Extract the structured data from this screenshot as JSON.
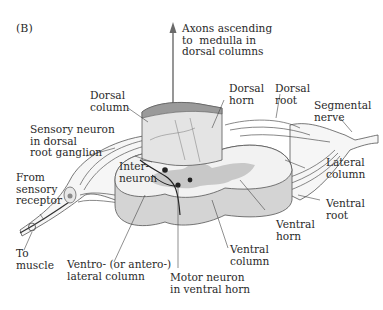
{
  "figure": {
    "panel_label": "(B)",
    "colors": {
      "white_matter": "#f2f2f2",
      "white_matter_side": "#d4d4d4",
      "gray_matter": "#c8c8c8",
      "dorsal_column_block": "#e4e4e4",
      "nerve_fiber": "#f6f6f6",
      "outline": "#555555",
      "arrow": "#6a6a6a",
      "neuron": "#222222",
      "ganglion_cell": "#8a8a8a"
    }
  },
  "labels": {
    "axons_ascending": "Axons ascending\nto  medulla in\ndorsal columns",
    "dorsal_column": "Dorsal\ncolumn",
    "dorsal_horn": "Dorsal\nhorn",
    "dorsal_root": "Dorsal\nroot",
    "segmental_nerve": "Segmental\nnerve",
    "sensory_neuron": "Sensory neuron\nin dorsal\nroot ganglion",
    "from_sensory_receptor": "From\nsensory\nreceptor",
    "interneuron": "Inter-\nneuron",
    "lateral_column": "Lateral\ncolumn",
    "ventral_root": "Ventral\nroot",
    "ventral_horn": "Ventral\nhorn",
    "ventral_column": "Ventral\ncolumn",
    "to_muscle": "To\nmuscle",
    "ventrolateral_column": "Ventro- (or antero-)\nlateral column",
    "motor_neuron": "Motor neuron\nin ventral horn"
  }
}
